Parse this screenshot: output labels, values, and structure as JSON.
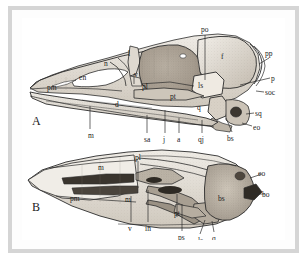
{
  "figure": {
    "caption_letters": [
      {
        "id": "A",
        "text": "A",
        "x": 10,
        "y": 100
      },
      {
        "id": "B",
        "text": "B",
        "x": 10,
        "y": 185
      }
    ],
    "panel_a": {
      "title": "A",
      "view": "lateral view of bird skull",
      "labels": [
        {
          "key": "po",
          "text": "po",
          "x": 179,
          "y": 8,
          "anchor": "start"
        },
        {
          "key": "pp",
          "text": "pp",
          "x": 243,
          "y": 32,
          "anchor": "start"
        },
        {
          "key": "p",
          "text": "p",
          "x": 249,
          "y": 57,
          "anchor": "start"
        },
        {
          "key": "soc",
          "text": "soc",
          "x": 243,
          "y": 71,
          "anchor": "start"
        },
        {
          "key": "sq",
          "text": "sq",
          "x": 233,
          "y": 92,
          "anchor": "start"
        },
        {
          "key": "eo",
          "text": "eo",
          "x": 231,
          "y": 106,
          "anchor": "start"
        },
        {
          "key": "bs",
          "text": "bs",
          "x": 205,
          "y": 117,
          "anchor": "start"
        },
        {
          "key": "f",
          "text": "f",
          "x": 199,
          "y": 35,
          "anchor": "start"
        },
        {
          "key": "ls",
          "text": "ls",
          "x": 176,
          "y": 64,
          "anchor": "start"
        },
        {
          "key": "q",
          "text": "q",
          "x": 175,
          "y": 86,
          "anchor": "start"
        },
        {
          "key": "pt",
          "text": "pt",
          "x": 148,
          "y": 75,
          "anchor": "start"
        },
        {
          "key": "pl",
          "text": "pl",
          "x": 120,
          "y": 65,
          "anchor": "start"
        },
        {
          "key": "v",
          "text": "v",
          "x": 112,
          "y": 53,
          "anchor": "start"
        },
        {
          "key": "l",
          "text": "l",
          "x": 106,
          "y": 32,
          "anchor": "start"
        },
        {
          "key": "n",
          "text": "n",
          "x": 82,
          "y": 42,
          "anchor": "start"
        },
        {
          "key": "en",
          "text": "en",
          "x": 57,
          "y": 56,
          "anchor": "start"
        },
        {
          "key": "pm",
          "text": "pm",
          "x": 25,
          "y": 66,
          "anchor": "start"
        },
        {
          "key": "d",
          "text": "d",
          "x": 93,
          "y": 83,
          "anchor": "start"
        },
        {
          "key": "m",
          "text": "m",
          "x": 66,
          "y": 114,
          "anchor": "start"
        },
        {
          "key": "sa",
          "text": "sa",
          "x": 122,
          "y": 118,
          "anchor": "start"
        },
        {
          "key": "j",
          "text": "j",
          "x": 141,
          "y": 118,
          "anchor": "start"
        },
        {
          "key": "a",
          "text": "a",
          "x": 155,
          "y": 118,
          "anchor": "start"
        },
        {
          "key": "qj",
          "text": "qj",
          "x": 176,
          "y": 118,
          "anchor": "start"
        }
      ],
      "leaders": [
        {
          "x1": 183,
          "y1": 17,
          "x2": 183,
          "y2": 62
        },
        {
          "x1": 247,
          "y1": 40,
          "x2": 237,
          "y2": 46
        },
        {
          "x1": 248,
          "y1": 60,
          "x2": 218,
          "y2": 67
        },
        {
          "x1": 242,
          "y1": 74,
          "x2": 234,
          "y2": 73
        },
        {
          "x1": 232,
          "y1": 95,
          "x2": 224,
          "y2": 96
        },
        {
          "x1": 230,
          "y1": 108,
          "x2": 220,
          "y2": 105
        },
        {
          "x1": 210,
          "y1": 114,
          "x2": 204,
          "y2": 100
        },
        {
          "x1": 112,
          "y1": 56,
          "x2": 112,
          "y2": 66
        },
        {
          "x1": 68,
          "y1": 111,
          "x2": 68,
          "y2": 88
        },
        {
          "x1": 125,
          "y1": 115,
          "x2": 125,
          "y2": 97
        },
        {
          "x1": 143,
          "y1": 115,
          "x2": 143,
          "y2": 92
        },
        {
          "x1": 157,
          "y1": 115,
          "x2": 157,
          "y2": 100
        },
        {
          "x1": 180,
          "y1": 115,
          "x2": 180,
          "y2": 102
        }
      ]
    },
    "panel_b": {
      "title": "B",
      "view": "ventral view of bird skull",
      "labels": [
        {
          "key": "pl",
          "text": "pl",
          "x": 113,
          "y": 136,
          "anchor": "start"
        },
        {
          "key": "m1",
          "text": "m",
          "x": 76,
          "y": 146,
          "anchor": "start"
        },
        {
          "key": "pm",
          "text": "pm",
          "x": 48,
          "y": 177,
          "anchor": "start"
        },
        {
          "key": "m2",
          "text": "m",
          "x": 103,
          "y": 178,
          "anchor": "start"
        },
        {
          "key": "eo",
          "text": "eo",
          "x": 236,
          "y": 152,
          "anchor": "start"
        },
        {
          "key": "bo",
          "text": "bo",
          "x": 240,
          "y": 173,
          "anchor": "start"
        },
        {
          "key": "bs",
          "text": "bs",
          "x": 196,
          "y": 177,
          "anchor": "start"
        },
        {
          "key": "pt",
          "text": "pt",
          "x": 152,
          "y": 192,
          "anchor": "start"
        },
        {
          "key": "v",
          "text": "v",
          "x": 106,
          "y": 207,
          "anchor": "start"
        },
        {
          "key": "in",
          "text": "in",
          "x": 123,
          "y": 207,
          "anchor": "start"
        },
        {
          "key": "ps",
          "text": "ps",
          "x": 156,
          "y": 216,
          "anchor": "start"
        },
        {
          "key": "ls",
          "text": "ls",
          "x": 176,
          "y": 219,
          "anchor": "start"
        },
        {
          "key": "q",
          "text": "q",
          "x": 190,
          "y": 217,
          "anchor": "start"
        }
      ],
      "leaders": [
        {
          "x1": 116,
          "y1": 143,
          "x2": 116,
          "y2": 163
        },
        {
          "x1": 109,
          "y1": 204,
          "x2": 109,
          "y2": 178
        },
        {
          "x1": 126,
          "y1": 204,
          "x2": 126,
          "y2": 172
        },
        {
          "x1": 155,
          "y1": 199,
          "x2": 155,
          "y2": 176
        },
        {
          "x1": 160,
          "y1": 213,
          "x2": 160,
          "y2": 186
        },
        {
          "x1": 178,
          "y1": 216,
          "x2": 183,
          "y2": 202
        },
        {
          "x1": 192,
          "y1": 214,
          "x2": 190,
          "y2": 203
        },
        {
          "x1": 240,
          "y1": 156,
          "x2": 228,
          "y2": 160
        },
        {
          "x1": 243,
          "y1": 176,
          "x2": 229,
          "y2": 176
        }
      ]
    },
    "colors": {
      "frame": "#d5d5d5",
      "background": "#ffffff",
      "ink": "#2b2b2b",
      "bone_light": "#e8e4dd",
      "bone_mid": "#c7bfb3",
      "bone_dark": "#9b9287"
    }
  }
}
